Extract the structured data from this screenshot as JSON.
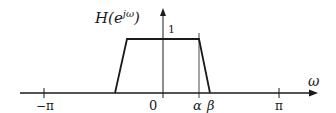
{
  "diagram": {
    "y_axis_label": {
      "base": "H(e",
      "superscript": "jω",
      "close": ")"
    },
    "x_axis_label": "ω",
    "peak_label": "1",
    "ticks": [
      {
        "label": "−π",
        "x": 44
      },
      {
        "label": "0",
        "x": 153
      },
      {
        "label": "α",
        "x": 197
      },
      {
        "label": "β",
        "x": 212
      },
      {
        "label": "π",
        "x": 279
      }
    ],
    "shape": {
      "type": "trapezoid",
      "points": [
        [
          115,
          93
        ],
        [
          127,
          39
        ],
        [
          199,
          39
        ],
        [
          210,
          93
        ]
      ]
    },
    "colors": {
      "stroke": "#1a1a1a",
      "background": "#ffffff"
    }
  }
}
